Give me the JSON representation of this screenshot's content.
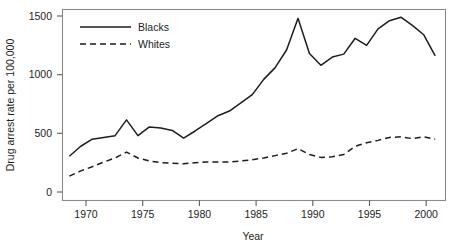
{
  "chart_data": {
    "type": "line",
    "title": "",
    "xlabel": "Year",
    "ylabel": "Drug arrest rate per 100,000",
    "xlim": [
      1968.4,
      2001.9
    ],
    "ylim": [
      0,
      1560
    ],
    "grid": false,
    "legend_position": "top-left inside plot area",
    "xticks": [
      1970,
      1975,
      1980,
      1985,
      1990,
      1995,
      2000
    ],
    "xtick_labels": [
      "1970",
      "1975",
      "1980",
      "1985",
      "1990",
      "1995",
      "2000"
    ],
    "yticks": [
      0,
      500,
      1000,
      1500
    ],
    "ytick_labels": [
      "0",
      "500",
      "1000",
      "1500"
    ],
    "x": [
      1969,
      1970,
      1971,
      1972,
      1973,
      1974,
      1975,
      1976,
      1977,
      1978,
      1979,
      1980,
      1981,
      1982,
      1983,
      1984,
      1985,
      1986,
      1987,
      1988,
      1989,
      1990,
      1991,
      1992,
      1993,
      1994,
      1995,
      1996,
      1997,
      1998,
      1999,
      2000,
      2001
    ],
    "series": [
      {
        "name": "Blacks",
        "style": "solid",
        "color": "#1d1d1d",
        "values": [
          305,
          390,
          450,
          465,
          480,
          615,
          480,
          555,
          545,
          525,
          460,
          520,
          585,
          650,
          690,
          760,
          830,
          960,
          1060,
          1210,
          1480,
          1180,
          1080,
          1150,
          1175,
          1310,
          1250,
          1390,
          1460,
          1490,
          1420,
          1340,
          1160
        ]
      },
      {
        "name": "Whites",
        "style": "dashed",
        "color": "#1d1d1d",
        "values": [
          135,
          180,
          215,
          255,
          290,
          340,
          290,
          265,
          250,
          245,
          240,
          250,
          255,
          255,
          255,
          265,
          275,
          290,
          310,
          330,
          370,
          320,
          295,
          300,
          320,
          390,
          420,
          440,
          465,
          470,
          455,
          470,
          450
        ]
      }
    ],
    "annotations": []
  },
  "legend": {
    "entries": [
      {
        "label": "Blacks",
        "style": "solid"
      },
      {
        "label": "Whites",
        "style": "dashed"
      }
    ]
  }
}
